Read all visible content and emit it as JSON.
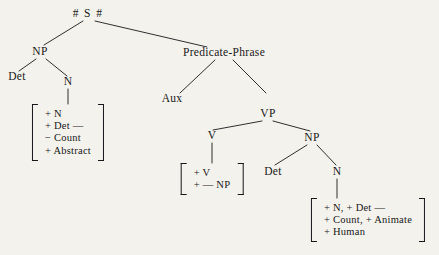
{
  "figure": {
    "type": "phrase-structure-tree",
    "background_color": "#f4f2ec",
    "ink_color": "#18181a"
  },
  "nodes": {
    "root": "# S #",
    "np_left": "NP",
    "det_left": "Det",
    "n_left": "N",
    "predicate_phrase": "Predicate-Phrase",
    "aux": "Aux",
    "vp": "VP",
    "v": "V",
    "np_right": "NP",
    "det_right": "Det",
    "n_right": "N"
  },
  "feature_matrices": {
    "subject_noun": {
      "rows": [
        "+ N",
        "+ Det —",
        "− Count",
        "+ Abstract"
      ]
    },
    "verb": {
      "rows": [
        "+ V",
        "+ — NP"
      ]
    },
    "object_noun": {
      "rows": [
        "+ N, + Det —",
        "+ Count, + Animate",
        "+ Human"
      ]
    }
  }
}
